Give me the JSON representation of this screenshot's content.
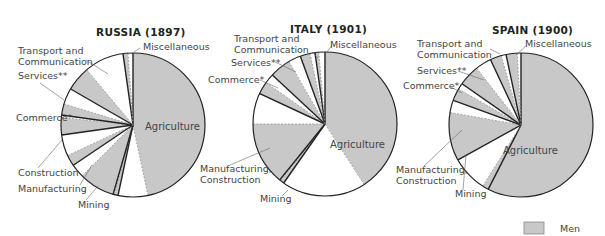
{
  "chart_data": [
    {
      "type": "pie",
      "title": "RUSSIA (1897)",
      "center": [
        133,
        125
      ],
      "radius": 72,
      "sectors": [
        {
          "name": "Agriculture",
          "start": 0,
          "end": 192,
          "men_end": 168
        },
        {
          "name": "Mining",
          "start": 192,
          "end": 196,
          "men_end": 195
        },
        {
          "name": "Manufacturing",
          "start": 196,
          "end": 236,
          "men_end": 225
        },
        {
          "name": "Construction",
          "start": 236,
          "end": 262,
          "men_end": 245
        },
        {
          "name": "Commerce*",
          "start": 262,
          "end": 278,
          "men_end": 276
        },
        {
          "name": "Services**",
          "start": 278,
          "end": 300,
          "men_end": 287
        },
        {
          "name": "Transport and Communication",
          "start": 300,
          "end": 352,
          "men_end": 320
        },
        {
          "name": "Miscellaneous",
          "start": 352,
          "end": 360,
          "men_end": 356
        }
      ]
    },
    {
      "type": "pie",
      "title": "ITALY (1901)",
      "center": [
        325,
        124
      ],
      "radius": 72,
      "sectors": [
        {
          "name": "Agriculture",
          "start": 0,
          "end": 215,
          "men_end": 147
        },
        {
          "name": "Mining",
          "start": 215,
          "end": 219,
          "men_end": 218
        },
        {
          "name": "Manufacturing, Construction",
          "start": 219,
          "end": 295,
          "men_end": 270
        },
        {
          "name": "Commerce*",
          "start": 295,
          "end": 313,
          "men_end": 305
        },
        {
          "name": "Services**",
          "start": 313,
          "end": 340,
          "men_end": 330
        },
        {
          "name": "Transport and Communication",
          "start": 340,
          "end": 352,
          "men_end": 348
        },
        {
          "name": "Miscellaneous",
          "start": 352,
          "end": 360,
          "men_end": 355
        }
      ]
    },
    {
      "type": "pie",
      "title": "SPAIN (1900)",
      "center": [
        521,
        125
      ],
      "radius": 72,
      "sectors": [
        {
          "name": "Agriculture",
          "start": 0,
          "end": 207,
          "men_end": 207
        },
        {
          "name": "Mining",
          "start": 207,
          "end": 241,
          "men_end": 212
        },
        {
          "name": "Manufacturing, Construction",
          "start": 241,
          "end": 290,
          "men_end": 280
        },
        {
          "name": "Commerce*",
          "start": 290,
          "end": 305,
          "men_end": 300
        },
        {
          "name": "Services**",
          "start": 305,
          "end": 335,
          "men_end": 322
        },
        {
          "name": "Transport and Communication",
          "start": 335,
          "end": 348,
          "men_end": 344
        },
        {
          "name": "Miscellaneous",
          "start": 348,
          "end": 360,
          "men_end": 357
        }
      ]
    }
  ],
  "titles": {
    "russia": "RUSSIA (1897)",
    "italy": "ITALY (1901)",
    "spain": "SPAIN (1900)"
  },
  "labels": {
    "russia": {
      "transport1": "Transport and",
      "transport2": "Communication",
      "misc": "Miscellaneous",
      "services": "Services**",
      "commerce": "Commerce*",
      "construction": "Construction",
      "manufacturing": "Manufacturing",
      "mining": "Mining",
      "agriculture": "Agriculture"
    },
    "italy": {
      "transport1": "Transport and",
      "transport2": "Communication",
      "misc": "Miscellaneous",
      "services": "Services**",
      "commerce": "Commerce*",
      "manuf1": "Manufacturing,",
      "manuf2": "Construction",
      "mining": "Mining",
      "agriculture": "Agriculture"
    },
    "spain": {
      "transport1": "Transport and",
      "transport2": "Communication",
      "misc": "Miscellaneous",
      "services": "Services**",
      "commerce": "Commerce*",
      "manuf1": "Manufacturing,",
      "manuf2": "Construction",
      "mining": "Mining",
      "agriculture": "Agriculture"
    }
  },
  "legend": {
    "men_label": "Men"
  },
  "colors": {
    "men": "#c8c8c8",
    "women": "#ffffff",
    "stroke": "#222222"
  }
}
